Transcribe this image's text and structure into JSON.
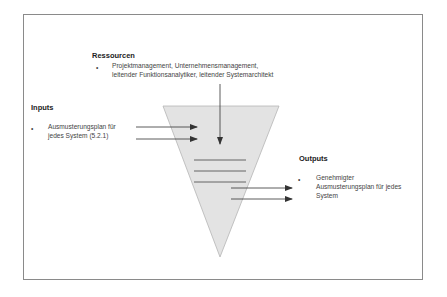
{
  "resources": {
    "title": "Ressourcen",
    "bullet": "•",
    "line1": "Projektmanagement, Unternehmensmanagement,",
    "line2": "leitender Funktionsanalytiker, leitender Systemarchitekt"
  },
  "inputs": {
    "title": "Inputs",
    "bullet": "•",
    "line1": "Ausmusterungsplan für",
    "line2": "jedes System (5.2.1)"
  },
  "outputs": {
    "title": "Outputs",
    "bullet": "•",
    "line1": "Genehmigter",
    "line2": "Ausmusterungsplan für jedes",
    "line3": "System"
  },
  "colors": {
    "funnel_fill": "#e3e3e3",
    "funnel_stroke": "#b5b5b5",
    "line": "#444444",
    "frame": "#8a8a8a"
  }
}
